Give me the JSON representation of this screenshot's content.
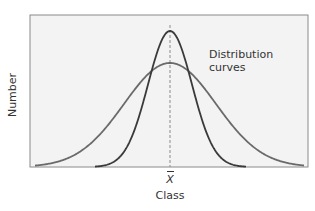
{
  "chart_data": {
    "type": "line",
    "title": "",
    "xlabel": "Class",
    "ylabel": "Number",
    "x_tick_labels": [
      "X̄"
    ],
    "annotation": [
      "Distribution",
      "curves"
    ],
    "grid": false,
    "legend": null,
    "mean_marker": {
      "label": "X̄",
      "style": "dashed vertical line at mean"
    },
    "series": [
      {
        "name": "Narrow distribution (low variance)",
        "shape": "normal",
        "relative_peak": 0.9,
        "relative_width": 0.55
      },
      {
        "name": "Wide distribution (high variance)",
        "shape": "normal",
        "relative_peak": 0.68,
        "relative_width": 1.0
      }
    ],
    "colors": {
      "frame": "#888888",
      "background": "#f3f3f3",
      "narrow_curve": "#3a3a3a",
      "wide_curve": "#6a6a6a",
      "mean_line": "#888888"
    }
  },
  "labels": {
    "ylabel": "Number",
    "xlabel": "Class",
    "mean": "X",
    "annotation_line1": "Distribution",
    "annotation_line2": "curves"
  }
}
